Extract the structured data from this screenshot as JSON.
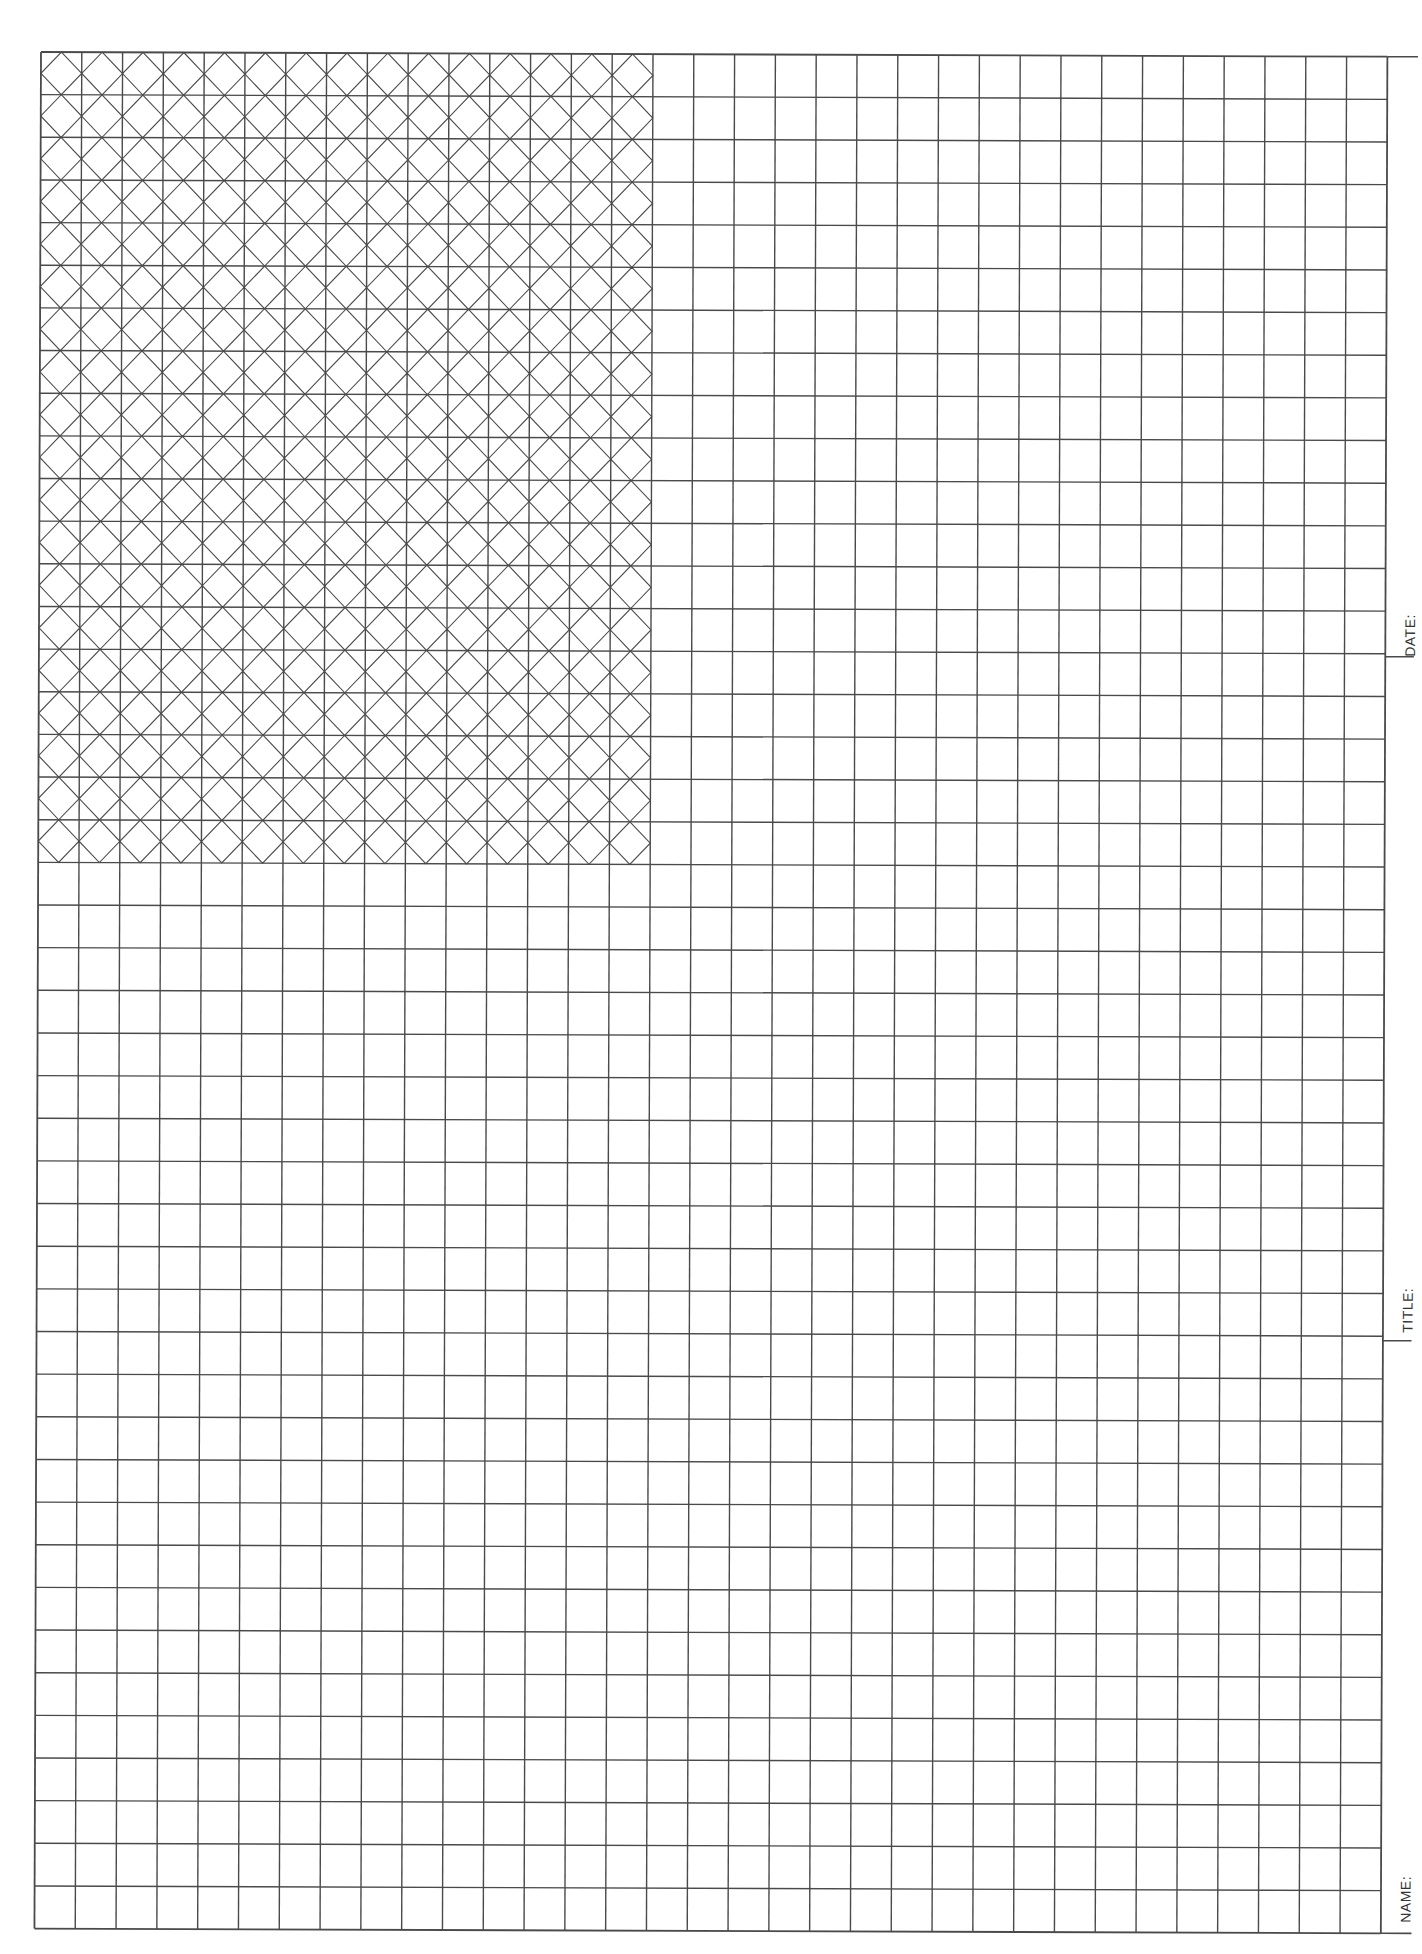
{
  "sheet": {
    "type": "graph paper with title block",
    "grid": {
      "columns": 33,
      "rows": 44,
      "cell_width_px": 40.8,
      "cell_height_px": 42.65,
      "origin_x": 41,
      "origin_y": 52,
      "line_color": "#4a4a4a"
    },
    "hatched_region": {
      "columns": 15,
      "rows": 19,
      "pattern": "diagonal diamond lattice"
    }
  },
  "title_block": {
    "date_label": "DATE:",
    "title_label": "TITLE:",
    "name_label": "NAME:"
  }
}
